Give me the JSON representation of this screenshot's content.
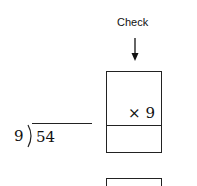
{
  "check": {
    "label": "Check",
    "arrow_icon": "down-arrow"
  },
  "check_box": {
    "multiplier_text": "× 9",
    "top_value": "",
    "bottom_value": ""
  },
  "second_box": {
    "value": ""
  },
  "division": {
    "divisor": "9",
    "dividend": "54",
    "quotient": ""
  }
}
